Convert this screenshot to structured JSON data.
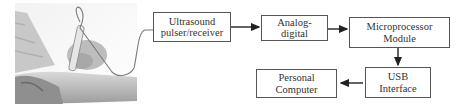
{
  "photo": {
    "description": "hand holding ultrasound probe against forearm, grayscale photo",
    "cable_color": "#7a7a7a"
  },
  "blocks": [
    {
      "id": "ultrasound",
      "lines": [
        "Ultrasound",
        "pulser/receiver"
      ]
    },
    {
      "id": "adc",
      "lines": [
        "Analog-",
        "digital"
      ]
    },
    {
      "id": "micro",
      "lines": [
        "Microprocessor",
        "Module"
      ]
    },
    {
      "id": "usb",
      "lines": [
        "USB",
        "Interface"
      ]
    },
    {
      "id": "pc",
      "lines": [
        "Personal",
        "Computer"
      ]
    }
  ],
  "connections": [
    {
      "from": "probe",
      "to": "ultrasound",
      "style": "cable"
    },
    {
      "from": "ultrasound",
      "to": "adc",
      "style": "arrow"
    },
    {
      "from": "adc",
      "to": "micro",
      "style": "arrow"
    },
    {
      "from": "micro",
      "to": "usb",
      "style": "arrow"
    },
    {
      "from": "usb",
      "to": "pc",
      "style": "arrow"
    }
  ],
  "colors": {
    "border": "#555555",
    "text": "#333333",
    "arrow": "#222222"
  }
}
